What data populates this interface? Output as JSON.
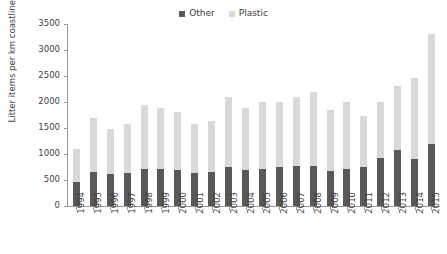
{
  "chart_data": {
    "type": "bar",
    "subtype": "stacked-vertical",
    "title": "",
    "xlabel": "",
    "ylabel": "Litter items per km coastline (no. pieces)",
    "ylim": [
      0,
      3500
    ],
    "ytick_labels": [
      "0",
      "500",
      "1000",
      "1500",
      "2000",
      "2500",
      "3000",
      "3500"
    ],
    "ytick_values": [
      0,
      500,
      1000,
      1500,
      2000,
      2500,
      3000,
      3500
    ],
    "grid": false,
    "legend_position": "top-center",
    "categories": [
      "1994",
      "1995",
      "1996",
      "1997",
      "1998",
      "1999",
      "2000",
      "2001",
      "2002",
      "2003",
      "2004",
      "2005",
      "2006",
      "2007",
      "2008",
      "2009",
      "2010",
      "2011",
      "2012",
      "2013",
      "2014",
      "2015"
    ],
    "series": [
      {
        "name": "Other",
        "color": "#595959",
        "values": [
          470,
          660,
          610,
          630,
          710,
          715,
          685,
          640,
          645,
          750,
          690,
          720,
          745,
          765,
          765,
          680,
          720,
          750,
          925,
          1080,
          910,
          1195
        ]
      },
      {
        "name": "Plastic",
        "color": "#d9d9d9",
        "values": [
          630,
          1030,
          880,
          950,
          1230,
          1165,
          1115,
          940,
          995,
          1340,
          1190,
          1280,
          1255,
          1335,
          1435,
          1170,
          1280,
          990,
          1075,
          1230,
          1560,
          2105
        ]
      }
    ],
    "totals": [
      1100,
      1690,
      1490,
      1580,
      1940,
      1880,
      1800,
      1580,
      1640,
      2090,
      1880,
      2000,
      2000,
      2100,
      2200,
      1850,
      2000,
      1740,
      2000,
      2310,
      2470,
      3300
    ]
  },
  "legend": {
    "items": [
      {
        "label": "Other",
        "color": "#595959"
      },
      {
        "label": "Plastic",
        "color": "#d9d9d9"
      }
    ]
  },
  "axes": {
    "y_title": "Litter items per km coastline (no. pieces)"
  }
}
